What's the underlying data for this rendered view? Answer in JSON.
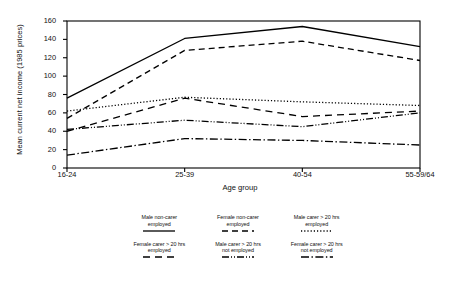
{
  "chart_data": {
    "type": "line",
    "title": "",
    "xlabel": "Age group",
    "ylabel": "Mean current net income (1985 prices)",
    "categories": [
      "16-24",
      "25-39",
      "40-54",
      "55-59/64"
    ],
    "ylim": [
      0,
      160
    ],
    "yticks": [
      0,
      20,
      40,
      60,
      80,
      100,
      120,
      140,
      160
    ],
    "grid": false,
    "legend_position": "below",
    "series": [
      {
        "name": "Male non-carer employed",
        "label_line1": "Male non-carer",
        "label_line2": "employed",
        "style": "solid",
        "dash": "none",
        "color": "#000000",
        "width": 1.3,
        "values": [
          76,
          141,
          154,
          132
        ]
      },
      {
        "name": "Female non-carer employed",
        "label_line1": "Female non-carer",
        "label_line2": "employed",
        "style": "dashed",
        "dash": "6 4",
        "color": "#000000",
        "width": 1.3,
        "values": [
          54,
          128,
          138,
          117
        ]
      },
      {
        "name": "Male carer > 20 hrs employed",
        "label_line1": "Male carer > 20 hrs",
        "label_line2": "employed",
        "style": "dotted",
        "dash": "1.2 2",
        "color": "#000000",
        "width": 1.3,
        "values": [
          62,
          77,
          72,
          68
        ]
      },
      {
        "name": "Female carer > 20 hrs employed",
        "label_line1": "Female carer > 20 hrs",
        "label_line2": "employed",
        "style": "long-dash",
        "dash": "7 5",
        "color": "#000000",
        "width": 1.3,
        "values": [
          40,
          76,
          56,
          62
        ]
      },
      {
        "name": "Male carer > 20 hrs not employed",
        "label_line1": "Male carer > 20 hrs",
        "label_line2": "not employed",
        "style": "dash-dot-dot",
        "dash": "7 2 1 2 1 2",
        "color": "#000000",
        "width": 1.3,
        "values": [
          42,
          52,
          45,
          60
        ]
      },
      {
        "name": "Female carer > 20 hrs not employed",
        "label_line1": "Female carer > 20 hrs",
        "label_line2": "not employed",
        "style": "dash-dot",
        "dash": "8 2.5 1.4 2.5",
        "color": "#000000",
        "width": 1.3,
        "values": [
          14,
          32,
          30,
          25
        ]
      }
    ]
  },
  "axes": {
    "frame_color": "#000000"
  }
}
